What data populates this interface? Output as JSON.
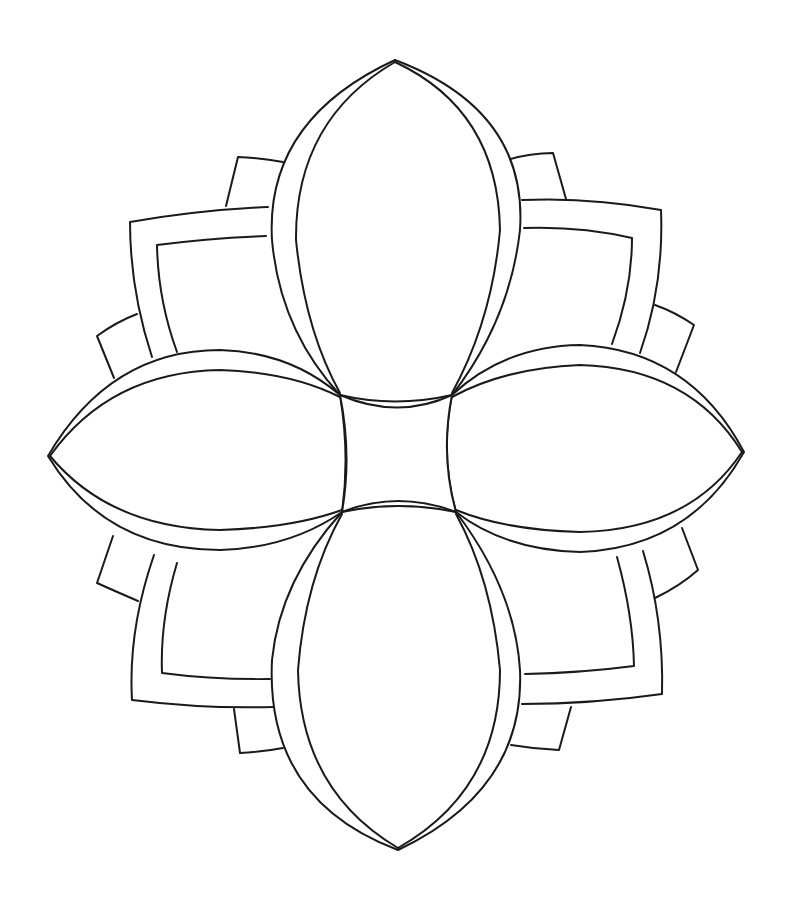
{
  "drawing": {
    "description": "Line-art flower coloring page",
    "background": "#ffffff",
    "stroke_color": "#1a1a1a",
    "petals": [
      "top",
      "right",
      "bottom",
      "left"
    ],
    "corner_frames": [
      "top-left",
      "top-right",
      "bottom-right",
      "bottom-left"
    ],
    "center": "concave square"
  }
}
